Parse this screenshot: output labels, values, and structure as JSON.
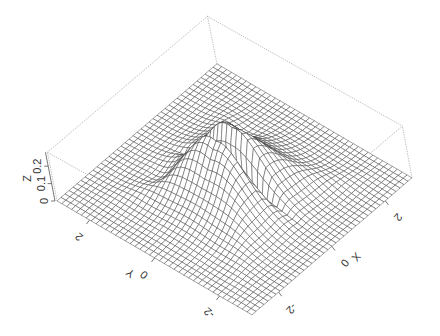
{
  "chart_data": {
    "type": "surface3d",
    "title": "",
    "xlabel": "X",
    "ylabel": "Y",
    "zlabel": "Z",
    "x_range": [
      -3,
      3
    ],
    "y_range": [
      -3,
      3
    ],
    "z_range": [
      0,
      0.28
    ],
    "x_ticks": [
      -2,
      0,
      2
    ],
    "y_ticks": [
      -2,
      0,
      2
    ],
    "z_ticks": [
      0,
      0.1,
      0.2
    ],
    "x_tick_labels": [
      "-2",
      "0",
      "2"
    ],
    "y_tick_labels": [
      "-2",
      "0",
      "2"
    ],
    "z_tick_labels": [
      "0",
      "0.1",
      "0.2"
    ],
    "grid_cells": 40,
    "surface_description": "Flat plane at z=0 with a central peak (max about 0.27) having a narrow slit/crease along the x=0 line, with four ridge lobes extending diagonally",
    "box": true,
    "mesh_color": "#333333",
    "face_color": "#ffffff",
    "box_line_style": "dotted"
  }
}
